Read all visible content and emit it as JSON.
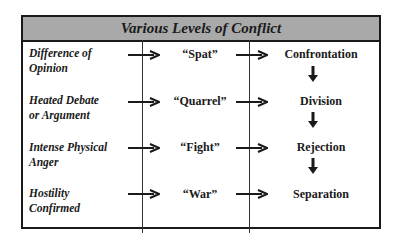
{
  "title": "Various Levels of Conflict",
  "colors": {
    "header_fill": "#a9a9a9",
    "border": "#1a1a1a",
    "text": "#1a1a1a"
  },
  "rows": [
    {
      "level": [
        "Difference of",
        "Opinion"
      ],
      "term": "“Spat”",
      "result": "Confrontation"
    },
    {
      "level": [
        "Heated Debate",
        "or Argument"
      ],
      "term": "“Quarrel”",
      "result": "Division"
    },
    {
      "level": [
        "Intense Physical",
        "Anger"
      ],
      "term": "“Fight”",
      "result": "Rejection"
    },
    {
      "level": [
        "Hostility",
        "Confirmed"
      ],
      "term": "“War”",
      "result": "Separation"
    }
  ],
  "icons": {
    "right_arrow": "arrow-right-icon",
    "down_arrow": "arrow-down-icon"
  }
}
